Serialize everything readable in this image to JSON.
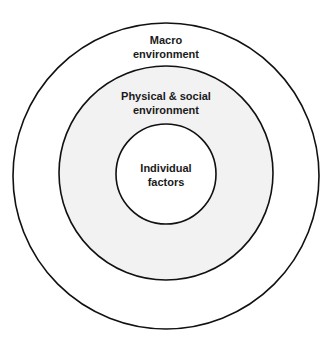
{
  "diagram": {
    "type": "concentric-circles",
    "colors": {
      "stroke": "#111111",
      "ring_fill": "#f2f2f2",
      "background": "#ffffff"
    },
    "layers": [
      {
        "id": "macro",
        "label_line1": "Macro",
        "label_line2": "environment"
      },
      {
        "id": "physical-social",
        "label_line1": "Physical & social",
        "label_line2": "environment"
      },
      {
        "id": "individual",
        "label_line1": "Individual",
        "label_line2": "factors"
      }
    ]
  }
}
